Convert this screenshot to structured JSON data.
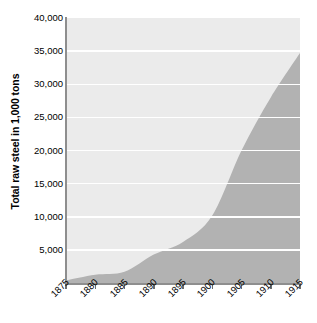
{
  "chart_data": {
    "type": "area",
    "title": "",
    "xlabel": "",
    "ylabel": "Total raw steel in 1,000 tons",
    "xlim": [
      1875,
      1915
    ],
    "ylim": [
      0,
      40000
    ],
    "grid": true,
    "legend": "none",
    "y_ticks": [
      0,
      5000,
      10000,
      15000,
      20000,
      25000,
      30000,
      35000,
      40000
    ],
    "y_tick_labels": [
      "",
      "5,000",
      "10,000",
      "15,000",
      "20,000",
      "25,000",
      "30,000",
      "35,000",
      "40,000"
    ],
    "x_ticks": [
      1875,
      1880,
      1885,
      1890,
      1895,
      1900,
      1905,
      1910,
      1915
    ],
    "x_tick_labels": [
      "1875",
      "1880",
      "1885",
      "1890",
      "1895",
      "1900",
      "1905",
      "1910",
      "1915"
    ],
    "series_name": "Total raw steel",
    "x": [
      1875,
      1880,
      1885,
      1890,
      1895,
      1900,
      1905,
      1910,
      1915
    ],
    "values": [
      400,
      1250,
      1700,
      4300,
      6200,
      10200,
      20000,
      28000,
      34700
    ],
    "points": [
      {
        "year": 1875,
        "value": 400
      },
      {
        "year": 1880,
        "value": 1250
      },
      {
        "year": 1885,
        "value": 1700
      },
      {
        "year": 1890,
        "value": 4300
      },
      {
        "year": 1895,
        "value": 6200
      },
      {
        "year": 1900,
        "value": 10200
      },
      {
        "year": 1905,
        "value": 20000
      },
      {
        "year": 1910,
        "value": 28000
      },
      {
        "year": 1915,
        "value": 34700
      }
    ],
    "colors": {
      "area_fill": "#b2b2b2",
      "plot_background": "#ebebeb",
      "gridline": "#ffffff",
      "axis_line": "#8e8e8e",
      "text": "#000000"
    }
  }
}
